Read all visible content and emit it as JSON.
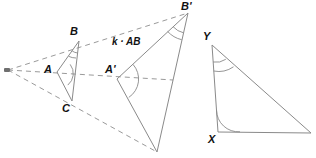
{
  "figure": {
    "width": 316,
    "height": 158,
    "background_color": "#ffffff",
    "solid_stroke_color": "#8a8a8a",
    "dashed_stroke_color": "#9a9a9a",
    "arc_stroke_color": "#8a8a8a",
    "label_color": "#111111",
    "center_marker_color": "#6f6f6f"
  },
  "labels": {
    "A": "A",
    "B": "B",
    "C": "C",
    "A_prime": "A'",
    "B_prime": "B'",
    "C_prime": "",
    "X": "X",
    "Y": "Y",
    "scale_expression": "k · AB"
  },
  "points": {
    "center": {
      "x": 8,
      "y": 70,
      "name": "center-of-dilation"
    },
    "A": {
      "x": 57,
      "y": 72
    },
    "B": {
      "x": 79,
      "y": 41
    },
    "C": {
      "x": 72,
      "y": 101
    },
    "A_prime": {
      "x": 117,
      "y": 79
    },
    "B_prime": {
      "x": 188,
      "y": 13
    },
    "C_prime": {
      "x": 157,
      "y": 152
    },
    "X": {
      "x": 218,
      "y": 132
    },
    "Y": {
      "x": 212,
      "y": 45
    },
    "Z": {
      "x": 311,
      "y": 133
    }
  },
  "angle_marks": {
    "A": {
      "arcs": 1,
      "vertex": "A"
    },
    "B": {
      "arcs": 2,
      "vertex": "B"
    },
    "A_prime": {
      "arcs": 1,
      "vertex": "A'"
    },
    "B_prime": {
      "arcs": 2,
      "vertex": "B'"
    },
    "X": {
      "arcs": 1,
      "vertex": "X"
    },
    "Y": {
      "arcs": 2,
      "vertex": "Y"
    }
  },
  "segments": {
    "solid": [
      {
        "name": "segment-AB",
        "from": "A",
        "to": "B"
      },
      {
        "name": "segment-BC",
        "from": "B",
        "to": "C"
      },
      {
        "name": "segment-CA",
        "from": "C",
        "to": "A"
      },
      {
        "name": "segment-A-prime-B-prime",
        "from": "A'",
        "to": "B'"
      },
      {
        "name": "segment-B-prime-C-prime",
        "from": "B'",
        "to": "C'"
      },
      {
        "name": "segment-C-prime-A-prime",
        "from": "C'",
        "to": "A'"
      },
      {
        "name": "segment-XY",
        "from": "X",
        "to": "Y"
      },
      {
        "name": "segment-YZ",
        "from": "Y",
        "to": "Z"
      },
      {
        "name": "segment-ZX",
        "from": "Z",
        "to": "X"
      }
    ],
    "dashed_rays": [
      {
        "name": "ray-center-through-A-to-A-prime",
        "from": "center",
        "to": "A'"
      },
      {
        "name": "ray-center-through-B-to-B-prime",
        "from": "center",
        "to": "B'"
      },
      {
        "name": "ray-center-through-C-to-C-prime",
        "from": "center",
        "to": "C'"
      }
    ]
  }
}
